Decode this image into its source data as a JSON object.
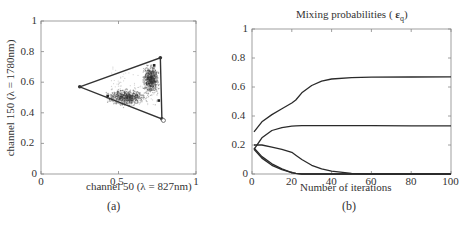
{
  "chart_data": [
    {
      "type": "scatter",
      "title": "",
      "caption": "(a)",
      "xlabel": "channel 50 (λ = 827nm)",
      "ylabel": "channel 150 (λ = 1780nm)",
      "xlim": [
        0,
        1
      ],
      "ylim": [
        0,
        1
      ],
      "xticks": [
        "0",
        "0.5",
        "1"
      ],
      "yticks": [
        "0",
        "0.2",
        "0.4",
        "0.6",
        "0.8",
        "1"
      ],
      "grid": false,
      "simplex_vertices": [
        [
          0.25,
          0.57
        ],
        [
          0.77,
          0.76
        ],
        [
          0.78,
          0.36
        ]
      ],
      "markers": [
        [
          0.43,
          0.51
        ],
        [
          0.73,
          0.71
        ],
        [
          0.76,
          0.48
        ],
        [
          0.79,
          0.35
        ]
      ],
      "clusters": [
        {
          "center": [
            0.55,
            0.5
          ],
          "spread": [
            0.09,
            0.04
          ]
        },
        {
          "center": [
            0.71,
            0.62
          ],
          "spread": [
            0.04,
            0.07
          ]
        }
      ]
    },
    {
      "type": "line",
      "title": "Mixing probabilities ( ε_q )",
      "caption": "(b)",
      "xlabel": "Number of iterations",
      "ylabel": "",
      "xlim": [
        0,
        100
      ],
      "ylim": [
        0,
        1
      ],
      "xticks": [
        "0",
        "20",
        "40",
        "60",
        "80",
        "100"
      ],
      "yticks": [
        "0",
        "0.2",
        "0.4",
        "0.6",
        "0.8",
        "1"
      ],
      "grid": false,
      "x": [
        1,
        5,
        10,
        15,
        20,
        22,
        25,
        30,
        35,
        40,
        50,
        60,
        80,
        100
      ],
      "series": [
        {
          "name": "q1",
          "values": [
            0.29,
            0.36,
            0.41,
            0.45,
            0.49,
            0.51,
            0.56,
            0.61,
            0.64,
            0.655,
            0.665,
            0.668,
            0.669,
            0.67
          ]
        },
        {
          "name": "q2",
          "values": [
            0.17,
            0.25,
            0.3,
            0.32,
            0.33,
            0.332,
            0.333,
            0.333,
            0.333,
            0.333,
            0.333,
            0.333,
            0.332,
            0.332
          ]
        },
        {
          "name": "q3",
          "values": [
            0.2,
            0.2,
            0.185,
            0.17,
            0.15,
            0.13,
            0.1,
            0.06,
            0.035,
            0.02,
            0.005,
            0.0,
            0.0,
            0.0
          ]
        },
        {
          "name": "q4",
          "values": [
            0.18,
            0.12,
            0.07,
            0.035,
            0.01,
            0.005,
            0.0,
            0.0,
            0.0,
            0.0,
            0.0,
            0.0,
            0.0,
            0.0
          ]
        },
        {
          "name": "q5",
          "values": [
            0.17,
            0.11,
            0.06,
            0.03,
            0.01,
            0.004,
            0.0,
            0.0,
            0.0,
            0.0,
            0.0,
            0.0,
            0.0,
            0.0
          ]
        }
      ]
    }
  ]
}
